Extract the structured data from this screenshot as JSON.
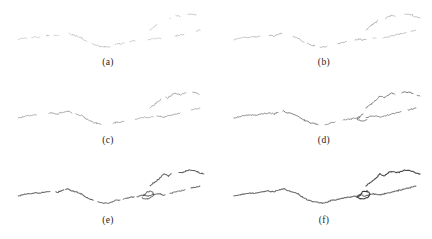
{
  "figure": {
    "type": "multi-panel-contour-figure",
    "background_color": "#ffffff",
    "stroke_color": "#3a3a3a",
    "panel_count": 6,
    "grid": {
      "rows": 3,
      "cols": 2
    },
    "panel_width": 216,
    "panel_height": 79
  },
  "panels": [
    {
      "id": "a",
      "label": "(a)",
      "opacity": 0.34,
      "stroke_width": 0.8,
      "completeness": 0.28,
      "description": "sparsest set of short faint contour fragments"
    },
    {
      "id": "b",
      "label": "(b)",
      "opacity": 0.42,
      "stroke_width": 0.85,
      "completeness": 0.38,
      "description": "slightly longer faint fragments, more of the lower ridge visible"
    },
    {
      "id": "c",
      "label": "(c)",
      "opacity": 0.5,
      "stroke_width": 0.9,
      "completeness": 0.52,
      "description": "fragments merging, upper right branch appearing"
    },
    {
      "id": "d",
      "label": "(d)",
      "opacity": 0.68,
      "stroke_width": 1.0,
      "completeness": 0.72,
      "description": "main ridge mostly continuous, darker stroke"
    },
    {
      "id": "e",
      "label": "(e)",
      "opacity": 0.82,
      "stroke_width": 1.05,
      "completeness": 0.86,
      "description": "near-continuous contour with small closed loop at right"
    },
    {
      "id": "f",
      "label": "(f)",
      "opacity": 1.0,
      "stroke_width": 1.1,
      "completeness": 1.0,
      "description": "fully connected dark contour with upper branch and loop"
    }
  ],
  "chart_data": {
    "type": "line",
    "title": "",
    "xlabel": "",
    "ylabel": "",
    "xlim": [
      0,
      216
    ],
    "ylim": [
      0,
      62
    ],
    "grid": false,
    "legend": null,
    "note": "Six panels show progressive completion of the same underlying contour. Coordinates are in panel pixel space; y increases downward. Each panel draws the shared polylines below, clipped to its completeness fraction and rendered at its opacity.",
    "series": [
      {
        "name": "main-ridge",
        "x": [
          18,
          26,
          34,
          40,
          46,
          52,
          58,
          63,
          68,
          72,
          77,
          82,
          86,
          90,
          95,
          100,
          104,
          108,
          112,
          116,
          120,
          124,
          128,
          132,
          136,
          140,
          144,
          148,
          152,
          156,
          160,
          164,
          168,
          172,
          176,
          180,
          184,
          188,
          192,
          196,
          200
        ],
        "y": [
          40,
          38,
          37,
          37,
          36,
          35,
          36,
          34,
          33,
          35,
          36,
          38,
          41,
          43,
          45,
          46,
          47,
          47,
          46,
          44,
          44,
          43,
          42,
          41,
          41,
          40,
          39,
          40,
          39,
          38,
          38,
          39,
          38,
          37,
          36,
          35,
          34,
          33,
          32,
          31,
          30
        ]
      },
      {
        "name": "upper-branch",
        "x": [
          150,
          155,
          160,
          164,
          168,
          172,
          176,
          180,
          184,
          188,
          192,
          196,
          200,
          204
        ],
        "y": [
          30,
          26,
          22,
          18,
          20,
          17,
          15,
          17,
          16,
          14,
          14,
          15,
          17,
          18
        ]
      },
      {
        "name": "loop",
        "x": [
          143,
          147,
          151,
          154,
          152,
          148,
          144,
          141,
          143
        ],
        "y": [
          40,
          36,
          35,
          38,
          41,
          43,
          43,
          41,
          40
        ]
      }
    ]
  }
}
